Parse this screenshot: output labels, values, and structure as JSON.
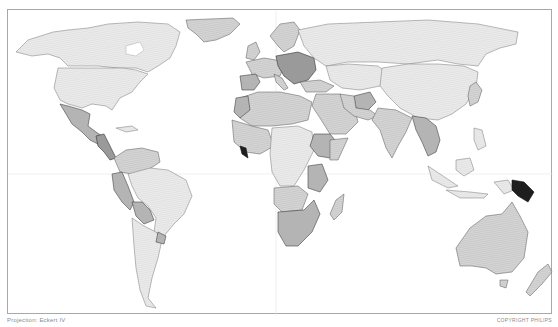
{
  "map": {
    "projection_label": "Projection: Eckert IV",
    "copyright_label": "COPYRIGHT PHILIPS",
    "type": "choropleth world map (grayscale)",
    "shading_levels": [
      {
        "level": 1,
        "color": "#e4e4e4",
        "description": "lightest hatched"
      },
      {
        "level": 2,
        "color": "#cfcfcf",
        "description": "light hatched"
      },
      {
        "level": 3,
        "color": "#b4b4b4",
        "description": "medium gray"
      },
      {
        "level": 4,
        "color": "#9a9a9a",
        "description": "darker gray"
      },
      {
        "level": 5,
        "color": "#1e1e1e",
        "description": "darkest / black"
      }
    ],
    "regions": [
      {
        "name": "Canada",
        "level": 1
      },
      {
        "name": "United States",
        "level": 1
      },
      {
        "name": "Greenland",
        "level": 2
      },
      {
        "name": "Mexico",
        "level": 3
      },
      {
        "name": "Central America",
        "level": 4
      },
      {
        "name": "Colombia / Venezuela",
        "level": 2
      },
      {
        "name": "Peru / Ecuador",
        "level": 3
      },
      {
        "name": "Brazil",
        "level": 1
      },
      {
        "name": "Bolivia",
        "level": 3
      },
      {
        "name": "Argentina / Chile",
        "level": 1
      },
      {
        "name": "Uruguay",
        "level": 3
      },
      {
        "name": "Western Europe",
        "level": 2
      },
      {
        "name": "Balkans / Eastern Europe",
        "level": 4
      },
      {
        "name": "Russia",
        "level": 1
      },
      {
        "name": "Central Asia",
        "level": 1
      },
      {
        "name": "Afghanistan",
        "level": 3
      },
      {
        "name": "Middle East",
        "level": 2
      },
      {
        "name": "China / Mongolia",
        "level": 1
      },
      {
        "name": "India",
        "level": 2
      },
      {
        "name": "Myanmar / SE Asia mainland",
        "level": 3
      },
      {
        "name": "North Africa",
        "level": 2
      },
      {
        "name": "West Africa",
        "level": 2
      },
      {
        "name": "Sierra Leone / Liberia",
        "level": 5
      },
      {
        "name": "Ethiopia",
        "level": 3
      },
      {
        "name": "Central Africa",
        "level": 1
      },
      {
        "name": "Tanzania",
        "level": 3
      },
      {
        "name": "Southern Africa",
        "level": 3
      },
      {
        "name": "Madagascar",
        "level": 2
      },
      {
        "name": "Indonesia",
        "level": 1
      },
      {
        "name": "Papua New Guinea",
        "level": 5
      },
      {
        "name": "Australia",
        "level": 2
      },
      {
        "name": "New Zealand",
        "level": 2
      },
      {
        "name": "Japan / Korea",
        "level": 2
      }
    ]
  }
}
